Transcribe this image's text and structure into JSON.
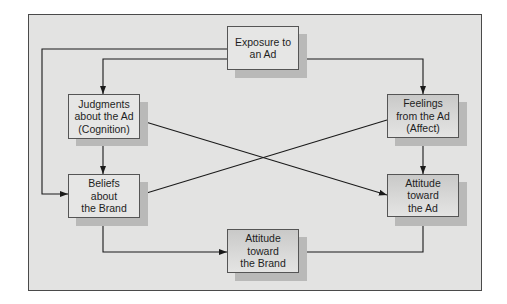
{
  "diagram": {
    "type": "flowchart",
    "nodes": [
      {
        "id": "exposure",
        "label": "Exposure to\nan Ad",
        "style": "light"
      },
      {
        "id": "judgments",
        "label": "Judgments\nabout the Ad\n(Cognition)",
        "style": "light"
      },
      {
        "id": "feelings",
        "label": "Feelings\nfrom the Ad\n(Affect)",
        "style": "dark"
      },
      {
        "id": "beliefs",
        "label": "Beliefs\nabout\nthe Brand",
        "style": "light"
      },
      {
        "id": "attitude_ad",
        "label": "Attitude\ntoward\nthe Ad",
        "style": "dark"
      },
      {
        "id": "attitude_brand",
        "label": "Attitude\ntoward\nthe Brand",
        "style": "dark"
      }
    ],
    "edges": [
      {
        "from": "exposure",
        "to": "judgments"
      },
      {
        "from": "exposure",
        "to": "feelings"
      },
      {
        "from": "exposure",
        "to": "beliefs"
      },
      {
        "from": "judgments",
        "to": "beliefs"
      },
      {
        "from": "judgments",
        "to": "attitude_ad"
      },
      {
        "from": "feelings",
        "to": "attitude_ad"
      },
      {
        "from": "feelings",
        "to": "beliefs"
      },
      {
        "from": "beliefs",
        "to": "attitude_brand"
      },
      {
        "from": "attitude_ad",
        "to": "attitude_brand"
      }
    ],
    "colors": {
      "panel_bg": "#e3e3e2",
      "border": "#4a4a4a",
      "line": "#1a1a1a",
      "shadow": "#b9b9b8",
      "box_light": "#e6e6e5",
      "box_dark": "#c9c9c8"
    }
  }
}
